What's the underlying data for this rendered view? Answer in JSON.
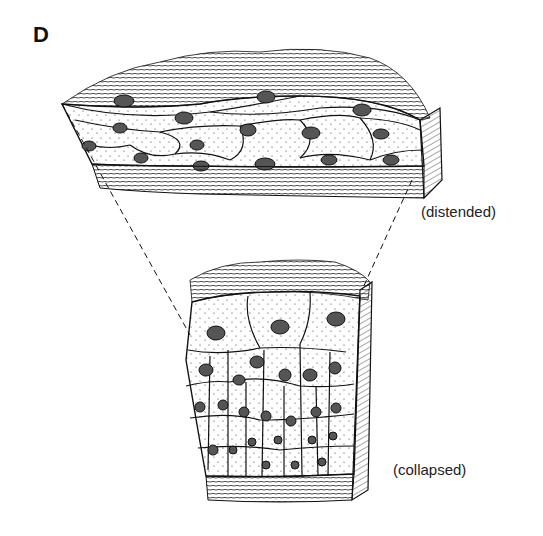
{
  "figure": {
    "panel_letter": "D",
    "labels": {
      "top_block": "(distended)",
      "bottom_block": "(collapsed)"
    },
    "colors": {
      "ink": "#111111",
      "background": "#ffffff"
    }
  }
}
